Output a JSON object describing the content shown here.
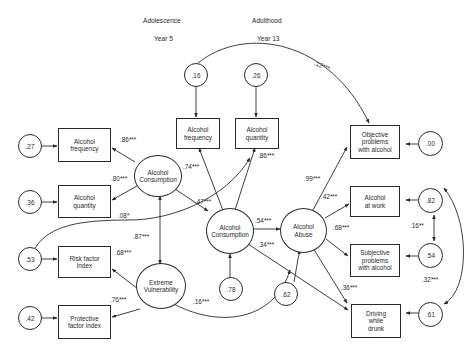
{
  "headers": {
    "period_left": "Adolescence",
    "year_left": "Year 5",
    "period_right": "Adulthood",
    "year_right": "Year 13"
  },
  "latent": {
    "consumption_adol": "Alcohol\nConsumption",
    "vulnerability": "Extreme\nVulnerability",
    "consumption_adult": "Alcohol\nConsumption",
    "abuse": "Alcohol\nAbuse"
  },
  "observed": {
    "freq_adol": "Alcohol\nfrequency",
    "qty_adol": "Alcohol\nquantity",
    "risk": "Risk factor\nindex",
    "protective": "Protective\nfactor index",
    "freq_adult": "Alcohol\nfrequency",
    "qty_adult": "Alcohol\nquantity",
    "objective": "Objective\nproblems\nwith alcohol",
    "work": "Alcohol\nat work",
    "subjective": "Subjective\nproblems\nwith alcohol",
    "driving": "Driving\nwhile\ndrunk"
  },
  "errors": {
    "freq_adol": ".27",
    "qty_adol": ".36",
    "risk": ".53",
    "protective": ".42",
    "freq_adult": ".16",
    "qty_adult": ".26",
    "consumption_adult": ".78",
    "abuse": ".62",
    "objective": ".00",
    "work": ".82",
    "subjective": ".54",
    "driving": ".61"
  },
  "coefficients": {
    "cons_freq": ".86***",
    "cons_qty": ".80***",
    "risk_to_adult_qty": ".08*",
    "cons_vuln_corr": ".87***",
    "vuln_risk": ".68***",
    "vuln_protective": ".76***",
    "vuln_abuse": ".16***",
    "adult_freq": ".74***",
    "cons_adol_to_adult": ".47***",
    "adult_qty": ".86***",
    "adult_to_abuse": ".54***",
    "adult_to_driving": ".34***",
    "abuse_objective": ".99***",
    "abuse_work": ".42***",
    "abuse_subjective": ".68***",
    "abuse_driving": ".36***",
    "freq_err_to_objective": ".12***",
    "work_subj_corr": ".16**",
    "work_driving_corr": ".32***"
  }
}
